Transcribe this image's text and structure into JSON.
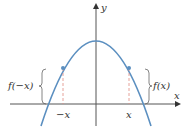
{
  "diagram": {
    "y_axis_label": "y",
    "x_axis_label": "x",
    "left_bracket_label": "f(−x)",
    "right_bracket_label": "f(x)",
    "left_tick_label": "−x",
    "right_tick_label": "x",
    "curve_color": "#5b8fc0",
    "dash_color": "#e08a80",
    "axis_color": "#555555"
  }
}
